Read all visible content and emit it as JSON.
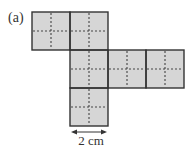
{
  "figure": {
    "part_label": "(a)",
    "fill_color": "#d6d6d6",
    "edge_color": "#333333",
    "squares": [
      {
        "x": 32,
        "y": 12
      },
      {
        "x": 70,
        "y": 12
      },
      {
        "x": 70,
        "y": 50
      },
      {
        "x": 108,
        "y": 50
      },
      {
        "x": 146,
        "y": 50
      },
      {
        "x": 70,
        "y": 88
      }
    ],
    "square_size": 38,
    "dimension": {
      "label": "2 cm"
    }
  }
}
